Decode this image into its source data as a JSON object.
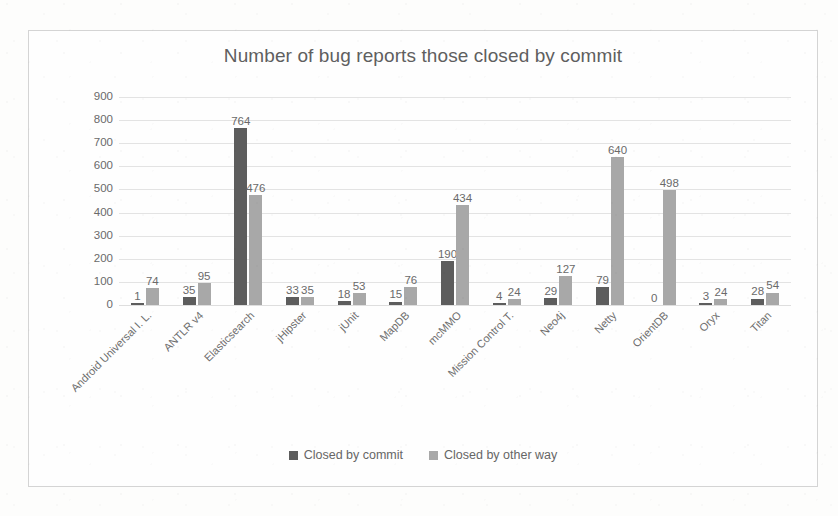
{
  "chart_data": {
    "type": "bar",
    "title": "Number of bug reports those closed by commit",
    "xlabel": "",
    "ylabel": "",
    "ylim": [
      0,
      900
    ],
    "ytick_step": 100,
    "yticks": [
      "900",
      "800",
      "700",
      "600",
      "500",
      "400",
      "300",
      "200",
      "100",
      "0"
    ],
    "grid": true,
    "legend_position": "bottom",
    "categories": [
      "Android Universal I. L.",
      "ANTLR v4",
      "Elasticsearch",
      "jHipster",
      "jUnit",
      "MapDB",
      "mcMMO",
      "Mission Control T.",
      "Neo4j",
      "Netty",
      "OrientDB",
      "Oryx",
      "Titan"
    ],
    "series": [
      {
        "name": "Closed by  commit",
        "color": "#5d5d5d",
        "values": [
          1,
          35,
          764,
          33,
          18,
          15,
          190,
          4,
          29,
          79,
          0,
          3,
          28
        ]
      },
      {
        "name": "Closed by other way",
        "color": "#a8a8a8",
        "values": [
          74,
          95,
          476,
          35,
          53,
          76,
          434,
          24,
          127,
          640,
          498,
          24,
          54
        ]
      }
    ]
  },
  "legend": {
    "items": [
      {
        "label": "Closed by  commit",
        "swatch": "legend-swatch-dark"
      },
      {
        "label": "Closed by other way",
        "swatch": "legend-swatch-light"
      }
    ]
  }
}
